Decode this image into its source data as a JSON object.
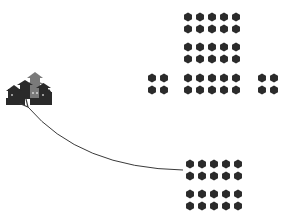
{
  "diagram": {
    "colors": {
      "background": "#ffffff",
      "token": "#2b2b2b",
      "arrow": "#3a3a3a",
      "castle_dark": "#2a2a2a",
      "castle_grey": "#7a7a7a"
    },
    "token_radius": 4.6,
    "groups": [
      {
        "name": "top-block-row-1",
        "cols": [
          188,
          200,
          212,
          224,
          236
        ],
        "rows": [
          17,
          29
        ]
      },
      {
        "name": "top-block-row-2",
        "cols": [
          188,
          200,
          212,
          224,
          236
        ],
        "rows": [
          47,
          59
        ]
      },
      {
        "name": "center-block",
        "cols": [
          188,
          200,
          212,
          224,
          236
        ],
        "rows": [
          78,
          90
        ]
      },
      {
        "name": "left-flank",
        "cols": [
          152,
          164
        ],
        "rows": [
          78,
          90
        ]
      },
      {
        "name": "right-flank",
        "cols": [
          262,
          274
        ],
        "rows": [
          78,
          90
        ]
      },
      {
        "name": "rear-block-a",
        "cols": [
          190,
          202,
          214,
          226,
          238
        ],
        "rows": [
          164,
          176
        ]
      },
      {
        "name": "rear-block-b",
        "cols": [
          190,
          202,
          214,
          226,
          238
        ],
        "rows": [
          194,
          206
        ]
      }
    ],
    "arrow": {
      "start": [
        183,
        170
      ],
      "control": [
        80,
        168
      ],
      "end": [
        28,
        107
      ]
    },
    "castle": {
      "x": 6,
      "y": 72,
      "width": 46,
      "height": 33
    }
  }
}
